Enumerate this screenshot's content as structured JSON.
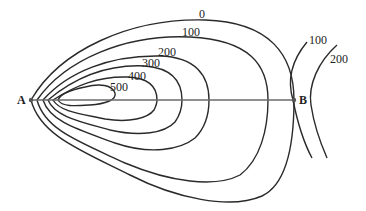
{
  "diagram": {
    "type": "contour-map",
    "points": [
      {
        "id": "A",
        "label": "A"
      },
      {
        "id": "B",
        "label": "B"
      }
    ],
    "profile_line": {
      "from": "A",
      "to": "B"
    },
    "hill_contours": [
      {
        "value": 0,
        "label": "0"
      },
      {
        "value": 100,
        "label": "100"
      },
      {
        "value": 200,
        "label": "200"
      },
      {
        "value": 300,
        "label": "300"
      },
      {
        "value": 400,
        "label": "400"
      },
      {
        "value": 500,
        "label": "500"
      }
    ],
    "right_contours": [
      {
        "value": 100,
        "label": "100"
      },
      {
        "value": 200,
        "label": "200"
      }
    ],
    "colors": {
      "line": "#2a2a2a",
      "profile": "#6a6a6a",
      "background": "#ffffff"
    }
  }
}
